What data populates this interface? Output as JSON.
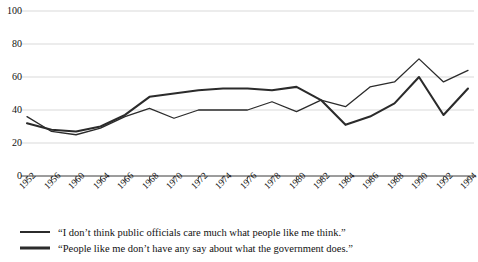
{
  "chart_data": {
    "type": "line",
    "title": "",
    "subtitle": "",
    "xlabel": "",
    "ylabel": "",
    "ylim": [
      0,
      100
    ],
    "ytick_values": [
      0,
      20,
      40,
      60,
      80,
      100
    ],
    "ytick_labels": [
      "0",
      "20",
      "40",
      "60",
      "80",
      "100"
    ],
    "grid": "horizontal",
    "legend_position": "below",
    "categories": [
      "1952",
      "1956",
      "1960",
      "1964",
      "1966",
      "1968",
      "1970",
      "1972",
      "1974",
      "1976",
      "1978",
      "1980",
      "1982",
      "1984",
      "1986",
      "1988",
      "1990",
      "1992",
      "1994"
    ],
    "series": [
      {
        "name": "“I don’t think public officials care much what people like me think.”",
        "style": "thin",
        "color": "#2b2b2b",
        "values": [
          36,
          27,
          25,
          29,
          36,
          41,
          35,
          40,
          40,
          40,
          45,
          39,
          46,
          42,
          54,
          57,
          71,
          57,
          64
        ]
      },
      {
        "name": "“People like me don’t have any say about what the government does.”",
        "style": "thick",
        "color": "#2b2b2b",
        "values": [
          32,
          28,
          27,
          30,
          37,
          48,
          50,
          52,
          53,
          53,
          52,
          54,
          46,
          31,
          36,
          44,
          60,
          37,
          53
        ]
      }
    ]
  },
  "legend": {
    "items": [
      {
        "label": "“I don’t think public officials care much what people like me think.”",
        "style": "thin"
      },
      {
        "label": "“People like me don’t have any say about what the government does.”",
        "style": "thick"
      }
    ]
  }
}
